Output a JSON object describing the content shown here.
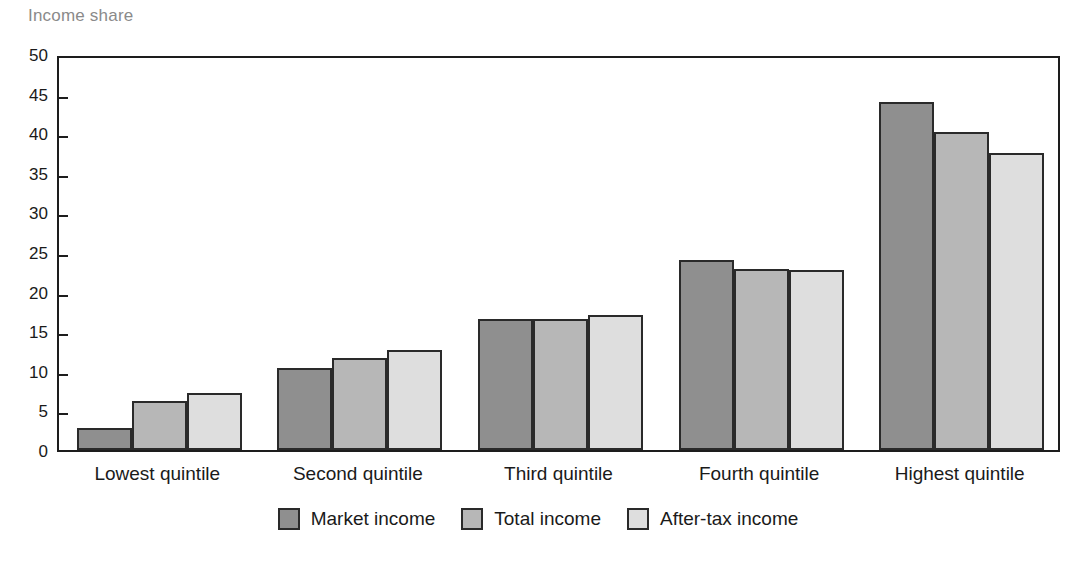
{
  "chart_data": {
    "type": "bar",
    "title": "Income share",
    "xlabel": "",
    "ylabel": "Income share",
    "ylim": [
      0,
      50
    ],
    "ytick_step": 5,
    "yticks": [
      0,
      5,
      10,
      15,
      20,
      25,
      30,
      35,
      40,
      45,
      50
    ],
    "grid": false,
    "legend_position": "bottom-center",
    "categories": [
      "Lowest quintile",
      "Second quintile",
      "Third quintile",
      "Fourth quintile",
      "Highest quintile"
    ],
    "series": [
      {
        "name": "Market income",
        "color": "#8f8f8f",
        "values": [
          2.8,
          10.3,
          16.6,
          24.0,
          43.9
        ]
      },
      {
        "name": "Total income",
        "color": "#b7b7b7",
        "values": [
          6.2,
          11.6,
          16.6,
          22.8,
          40.2
        ]
      },
      {
        "name": "After-tax income",
        "color": "#dedede",
        "values": [
          7.2,
          12.6,
          17.1,
          22.7,
          37.5
        ]
      }
    ]
  },
  "style": {
    "title_color": "#8a8a8a",
    "axis_color": "#1d1d1d",
    "bar_border_color": "#2a2a2a",
    "background": "#ffffff"
  }
}
